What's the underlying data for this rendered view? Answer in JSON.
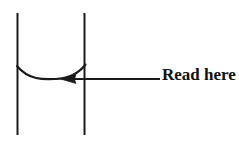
{
  "diagram": {
    "background_color": "#ffffff",
    "stroke_color": "#1a1a1a",
    "annotation": {
      "label": "Read here",
      "text_color": "#111111",
      "arrow_direction": "left"
    },
    "geometry": {
      "left_wall": {
        "x": 17,
        "y_top": 13,
        "y_bottom": 135
      },
      "right_wall": {
        "x": 84,
        "y_top": 13,
        "y_bottom": 135
      },
      "meniscus": {
        "left_x": 17,
        "left_y": 66,
        "right_x": 85,
        "right_y": 65,
        "bottom_x": 55,
        "bottom_y": 79
      },
      "arrow": {
        "tip_x": 61,
        "tip_y": 79,
        "tail_x": 160,
        "tail_y": 79
      }
    }
  }
}
